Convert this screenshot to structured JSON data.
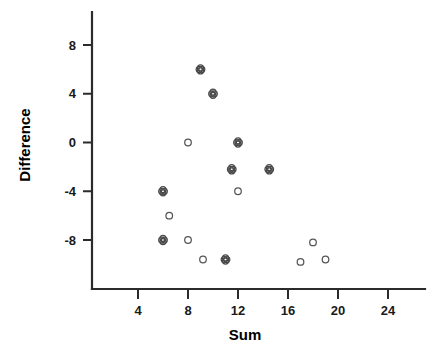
{
  "chart_data": {
    "type": "scatter",
    "title": "",
    "xlabel": "Sum",
    "ylabel": "Difference",
    "xlim": [
      2,
      26.4
    ],
    "ylim": [
      -10.6,
      10.2
    ],
    "grid": false,
    "legend": "none",
    "x_ticks": [
      4,
      8,
      12,
      16,
      20,
      24
    ],
    "x_tick_labels": [
      "4",
      "8",
      "12",
      "16",
      "20",
      "24"
    ],
    "y_ticks": [
      8,
      4,
      0,
      -4,
      -8
    ],
    "y_tick_labels": [
      "8",
      "4",
      "0",
      "-4",
      "-8"
    ],
    "marker_types": {
      "single": "open-circle (1 observation)",
      "double": "overlapping open circles (2 coincident observations)"
    },
    "points": [
      {
        "x": 9.0,
        "y": 6.0,
        "marker": "double"
      },
      {
        "x": 10.0,
        "y": 4.0,
        "marker": "double"
      },
      {
        "x": 8.0,
        "y": 0.0,
        "marker": "single"
      },
      {
        "x": 12.0,
        "y": 0.0,
        "marker": "double"
      },
      {
        "x": 11.5,
        "y": -2.2,
        "marker": "double"
      },
      {
        "x": 14.5,
        "y": -2.2,
        "marker": "double"
      },
      {
        "x": 12.0,
        "y": -4.0,
        "marker": "single"
      },
      {
        "x": 6.0,
        "y": -4.0,
        "marker": "double"
      },
      {
        "x": 6.5,
        "y": -6.0,
        "marker": "single"
      },
      {
        "x": 6.0,
        "y": -8.0,
        "marker": "double"
      },
      {
        "x": 8.0,
        "y": -8.0,
        "marker": "single"
      },
      {
        "x": 18.0,
        "y": -8.2,
        "marker": "single"
      },
      {
        "x": 9.2,
        "y": -9.6,
        "marker": "single"
      },
      {
        "x": 11.0,
        "y": -9.6,
        "marker": "double"
      },
      {
        "x": 17.0,
        "y": -9.8,
        "marker": "single"
      },
      {
        "x": 19.0,
        "y": -9.6,
        "marker": "single"
      }
    ]
  },
  "axes": {
    "y_title": "Difference",
    "x_title": "Sum"
  }
}
